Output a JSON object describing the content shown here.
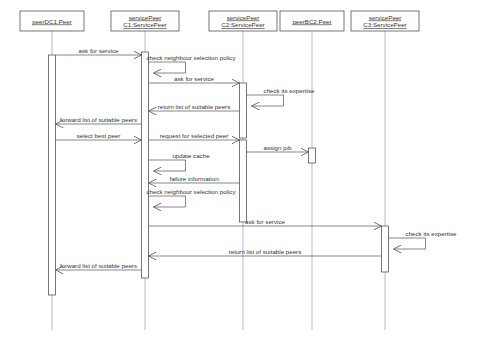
{
  "diagram": {
    "type": "uml-sequence-diagram",
    "width": 485,
    "height": 352,
    "background_color": "#ffffff",
    "line_color": "#555555",
    "lifeline_color": "#a8a8a8",
    "text_color": "#333333"
  },
  "participants": [
    {
      "id": "peerDC1",
      "line1": "peerDC1:Peer",
      "line2": "",
      "x": 52,
      "box": {
        "x": 20,
        "y": 11,
        "w": 64,
        "h": 20
      }
    },
    {
      "id": "servicePeerC1",
      "line1": "servicePeer",
      "line2": "C1:ServicePeer",
      "x": 145,
      "box": {
        "x": 111,
        "y": 11,
        "w": 68,
        "h": 20
      }
    },
    {
      "id": "servicePeerC2",
      "line1": "servicePeer",
      "line2": "C2:ServicePeer",
      "x": 243,
      "box": {
        "x": 209,
        "y": 11,
        "w": 68,
        "h": 20
      }
    },
    {
      "id": "peerBC2",
      "line1": "peerBC2:Peer",
      "line2": "",
      "x": 312,
      "box": {
        "x": 280,
        "y": 11,
        "w": 64,
        "h": 20
      }
    },
    {
      "id": "servicePeerC3",
      "line1": "servicePeer",
      "line2": "C3:ServicePeer",
      "x": 385,
      "box": {
        "x": 351,
        "y": 11,
        "w": 68,
        "h": 20
      }
    }
  ],
  "activations": [
    {
      "owner": "peerDC1",
      "x": 52,
      "y": 55,
      "h": 240,
      "w": 7
    },
    {
      "owner": "servicePeerC1",
      "x": 145,
      "y": 52,
      "h": 226,
      "w": 7
    },
    {
      "owner": "servicePeerC2",
      "x": 243,
      "y": 83,
      "h": 55,
      "w": 7
    },
    {
      "owner": "servicePeerC2",
      "x": 243,
      "y": 140,
      "h": 82,
      "w": 7
    },
    {
      "owner": "peerBC2",
      "x": 312,
      "y": 148,
      "h": 15,
      "w": 7
    },
    {
      "owner": "servicePeerC3",
      "x": 385,
      "y": 226,
      "h": 46,
      "w": 7
    }
  ],
  "messages": [
    {
      "label": "ask for service",
      "from": "peerDC1",
      "to": "servicePeerC1",
      "y": 55,
      "kind": "call",
      "direction": "right"
    },
    {
      "label": "check neighbour selection policy",
      "from": "servicePeerC1",
      "to": "servicePeerC1",
      "y": 62,
      "kind": "self",
      "direction": "self"
    },
    {
      "label": "ask for service",
      "from": "servicePeerC1",
      "to": "servicePeerC2",
      "y": 83,
      "kind": "call",
      "direction": "right"
    },
    {
      "label": "check its expertise",
      "from": "servicePeerC2",
      "to": "servicePeerC2",
      "y": 95,
      "kind": "self",
      "direction": "self"
    },
    {
      "label": "return list of suitable peers",
      "from": "servicePeerC2",
      "to": "servicePeerC1",
      "y": 111,
      "kind": "return",
      "direction": "left"
    },
    {
      "label": "forward list of suitable peers",
      "from": "servicePeerC1",
      "to": "peerDC1",
      "y": 124,
      "kind": "return",
      "direction": "left"
    },
    {
      "label": "select best peer",
      "from": "peerDC1",
      "to": "servicePeerC1",
      "y": 140,
      "kind": "call",
      "direction": "right"
    },
    {
      "label": "request for selected peer",
      "from": "servicePeerC1",
      "to": "servicePeerC2",
      "y": 140,
      "kind": "call",
      "direction": "right"
    },
    {
      "label": "assign job",
      "from": "servicePeerC2",
      "to": "peerBC2",
      "y": 152,
      "kind": "call",
      "direction": "right"
    },
    {
      "label": "update cache",
      "from": "servicePeerC1",
      "to": "servicePeerC1",
      "y": 160,
      "kind": "self",
      "direction": "self"
    },
    {
      "label": "failure information",
      "from": "servicePeerC2",
      "to": "servicePeerC1",
      "y": 183,
      "kind": "return",
      "direction": "left"
    },
    {
      "label": "check neighbour selection policy",
      "from": "servicePeerC1",
      "to": "servicePeerC1",
      "y": 196,
      "kind": "self",
      "direction": "self"
    },
    {
      "label": "ask for service",
      "from": "servicePeerC1",
      "to": "servicePeerC3",
      "y": 226,
      "kind": "call",
      "direction": "right"
    },
    {
      "label": "check its expertise",
      "from": "servicePeerC3",
      "to": "servicePeerC3",
      "y": 238,
      "kind": "self",
      "direction": "self"
    },
    {
      "label": "return list of suitable peers",
      "from": "servicePeerC3",
      "to": "servicePeerC1",
      "y": 256,
      "kind": "return",
      "direction": "left"
    },
    {
      "label": "forward list of suitable peers",
      "from": "servicePeerC1",
      "to": "peerDC1",
      "y": 270,
      "kind": "return",
      "direction": "left"
    }
  ]
}
